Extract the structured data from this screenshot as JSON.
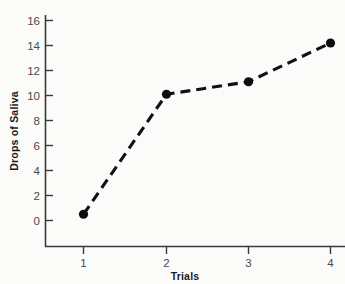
{
  "chart_data": {
    "type": "line",
    "title": "",
    "xlabel": "Trials",
    "ylabel": "Drops of Saliva",
    "x": [
      1,
      2,
      3,
      4
    ],
    "values": [
      0.5,
      10.1,
      11.1,
      14.2
    ],
    "series": [
      {
        "name": "Drops of Saliva",
        "values": [
          0.5,
          10.1,
          11.1,
          14.2
        ]
      }
    ],
    "xlim": [
      0.5,
      4.4
    ],
    "ylim": [
      0,
      16
    ],
    "x_tick_labels": [
      "1",
      "2",
      "3",
      "4"
    ],
    "y_tick_labels": [
      "0",
      "2",
      "4",
      "6",
      "8",
      "10",
      "12",
      "14",
      "16"
    ],
    "y_ticks": [
      0,
      2,
      4,
      6,
      8,
      10,
      12,
      14,
      16
    ],
    "grid": false,
    "legend": false,
    "legend_position": "none",
    "line_style": "dashed",
    "marker": "filled-circle",
    "line_color": "#111111",
    "marker_color": "#0d0d0d",
    "background_color": "#fbfbfa",
    "axis_color": "#3a3a3a"
  }
}
